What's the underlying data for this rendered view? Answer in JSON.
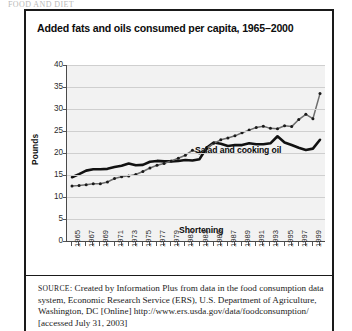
{
  "top_clip_text": "FOOD AND DIET",
  "figure": {
    "title": "Added fats and oils consumed per capita, 1965–2000",
    "source_label": "SOURCE",
    "source_text": ": Created by Information Plus from data in the food consumption data system, Economic Research Service (ERS), U.S. Department of Agriculture, Washington, DC [Online] http://www.ers.usda.gov/data/foodconsumption/ [accessed July 31, 2003]"
  },
  "chart_data": {
    "type": "line",
    "title": "Added fats and oils consumed per capita, 1965–2000",
    "xlabel": "",
    "ylabel": "Pounds",
    "ylim": [
      0,
      40
    ],
    "yticks": [
      0,
      5,
      10,
      15,
      20,
      25,
      30,
      35,
      40
    ],
    "grid": true,
    "legend_position": "inline-annotation",
    "x": [
      1965,
      1966,
      1967,
      1968,
      1969,
      1970,
      1971,
      1972,
      1973,
      1974,
      1975,
      1976,
      1977,
      1978,
      1979,
      1980,
      1981,
      1982,
      1983,
      1984,
      1985,
      1986,
      1987,
      1988,
      1989,
      1990,
      1991,
      1992,
      1993,
      1994,
      1995,
      1996,
      1997,
      1998,
      1999,
      2000
    ],
    "xtick_labels": [
      "1965",
      "1967",
      "1969",
      "1971",
      "1973",
      "1975",
      "1977",
      "1979",
      "1981",
      "1983",
      "1985",
      "1987",
      "1989",
      "1991",
      "1993",
      "1995",
      "1997",
      "1999"
    ],
    "series": [
      {
        "name": "Salad and cooking oil",
        "marker": "dot",
        "style": "gray-dotted",
        "color": "#6d6d6d",
        "values": [
          12.5,
          12.6,
          12.8,
          13.0,
          13.0,
          13.4,
          14.2,
          14.6,
          14.8,
          15.1,
          15.8,
          16.6,
          17.2,
          17.6,
          18.2,
          18.8,
          19.5,
          20.6,
          20.0,
          21.0,
          22.2,
          23.0,
          23.4,
          23.9,
          24.6,
          25.2,
          25.8,
          26.1,
          25.6,
          25.5,
          26.2,
          26.0,
          27.6,
          28.8,
          27.8,
          33.5
        ]
      },
      {
        "name": "Shortening",
        "marker": "none",
        "style": "thick-solid",
        "color": "#111111",
        "values": [
          14.5,
          15.2,
          16.0,
          16.3,
          16.3,
          16.4,
          16.8,
          17.1,
          17.6,
          17.2,
          17.3,
          18.0,
          18.2,
          18.1,
          18.1,
          18.2,
          18.4,
          18.3,
          18.6,
          21.2,
          22.4,
          22.1,
          21.6,
          21.8,
          21.8,
          22.2,
          22.0,
          22.0,
          22.2,
          23.8,
          22.4,
          21.8,
          21.2,
          20.7,
          21.0,
          23.0
        ]
      }
    ],
    "annotations": [
      {
        "text": "Salad and cooking oil",
        "x": 1981,
        "y": 27
      },
      {
        "text": "Shortening",
        "x": 1979,
        "y": 15.5
      }
    ]
  }
}
